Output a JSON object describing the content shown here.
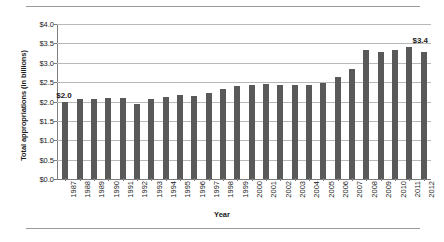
{
  "chart_data": {
    "type": "bar",
    "title": "",
    "xlabel": "Year",
    "ylabel": "Total appropriations (in billions)",
    "categories": [
      "1987",
      "1988",
      "1989",
      "1990",
      "1991",
      "1992",
      "1993",
      "1994",
      "1995",
      "1996",
      "1997",
      "1998",
      "1999",
      "2000",
      "2001",
      "2002",
      "2003",
      "2004",
      "2005",
      "2006",
      "2007",
      "2008",
      "2009",
      "2010",
      "2011",
      "2012"
    ],
    "values": [
      2.0,
      2.07,
      2.06,
      2.09,
      2.09,
      1.93,
      2.07,
      2.12,
      2.16,
      2.15,
      2.22,
      2.32,
      2.4,
      2.43,
      2.45,
      2.43,
      2.43,
      2.42,
      2.47,
      2.63,
      2.83,
      3.32,
      3.28,
      3.32,
      3.4,
      3.29
    ],
    "ylim": [
      0,
      4.0
    ],
    "ytick_values": [
      0.0,
      0.5,
      1.0,
      1.5,
      2.0,
      2.5,
      3.0,
      3.5,
      4.0
    ],
    "ytick_labels": [
      "$0.0",
      "$0.5",
      "$1.0",
      "$1.5",
      "$2.0",
      "$2.5",
      "$3.0",
      "$3.5",
      "$4.0"
    ],
    "grid": true,
    "legend": "none",
    "bar_color": "#595959",
    "grid_color": "#b8b8b8",
    "axis_color": "#7d7d7d",
    "annotations": [
      {
        "name": "first-value-label",
        "text": "$2.0",
        "category": "1987",
        "value": 2.0
      },
      {
        "name": "last-value-label",
        "text": "$3.4",
        "category": "2011",
        "value": 3.4
      }
    ]
  }
}
